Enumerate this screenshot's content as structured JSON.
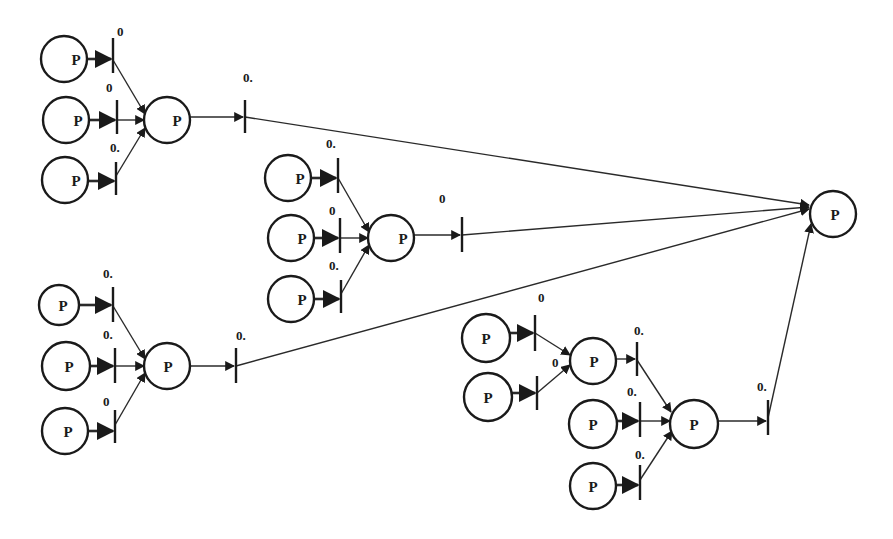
{
  "diagram": {
    "type": "petri-net",
    "colors": {
      "stroke": "#1a1a1a",
      "background": "#ffffff"
    },
    "places": [
      {
        "id": "p1",
        "label": "P",
        "cx": 64,
        "cy": 59,
        "r": 23,
        "lx": 76,
        "ly": 65
      },
      {
        "id": "p2",
        "label": "P",
        "cx": 66,
        "cy": 120,
        "r": 23,
        "lx": 78,
        "ly": 126
      },
      {
        "id": "p3",
        "label": "P",
        "cx": 65,
        "cy": 180,
        "r": 23,
        "lx": 76,
        "ly": 186
      },
      {
        "id": "p4",
        "label": "P",
        "cx": 167,
        "cy": 120,
        "r": 23,
        "lx": 177,
        "ly": 126
      },
      {
        "id": "p5",
        "label": "P",
        "cx": 288,
        "cy": 178,
        "r": 23,
        "lx": 300,
        "ly": 184
      },
      {
        "id": "p6",
        "label": "P",
        "cx": 291,
        "cy": 238,
        "r": 23,
        "lx": 302,
        "ly": 244
      },
      {
        "id": "p7",
        "label": "P",
        "cx": 291,
        "cy": 299,
        "r": 23,
        "lx": 302,
        "ly": 305
      },
      {
        "id": "p8",
        "label": "P",
        "cx": 391,
        "cy": 238,
        "r": 23,
        "lx": 403,
        "ly": 244
      },
      {
        "id": "p9",
        "label": "P",
        "cx": 59,
        "cy": 305,
        "r": 20,
        "lx": 63,
        "ly": 311
      },
      {
        "id": "p10",
        "label": "P",
        "cx": 66,
        "cy": 366,
        "r": 24,
        "lx": 69,
        "ly": 372
      },
      {
        "id": "p11",
        "label": "P",
        "cx": 65,
        "cy": 431,
        "r": 23,
        "lx": 68,
        "ly": 437
      },
      {
        "id": "p12",
        "label": "P",
        "cx": 167,
        "cy": 366,
        "r": 23,
        "lx": 168,
        "ly": 372
      },
      {
        "id": "p13",
        "label": "P",
        "cx": 486,
        "cy": 338,
        "r": 24,
        "lx": 486,
        "ly": 344
      },
      {
        "id": "p14",
        "label": "P",
        "cx": 488,
        "cy": 397,
        "r": 24,
        "lx": 488,
        "ly": 403
      },
      {
        "id": "p15",
        "label": "P",
        "cx": 593,
        "cy": 361,
        "r": 23,
        "lx": 594,
        "ly": 367
      },
      {
        "id": "p16",
        "label": "P",
        "cx": 593,
        "cy": 424,
        "r": 24,
        "lx": 593,
        "ly": 430
      },
      {
        "id": "p17",
        "label": "P",
        "cx": 593,
        "cy": 486,
        "r": 23,
        "lx": 593,
        "ly": 492
      },
      {
        "id": "p18",
        "label": "P",
        "cx": 694,
        "cy": 424,
        "r": 24,
        "lx": 694,
        "ly": 430
      },
      {
        "id": "p19",
        "label": "P",
        "cx": 833,
        "cy": 214,
        "r": 23,
        "lx": 835,
        "ly": 220
      }
    ],
    "transitions": [
      {
        "id": "t1",
        "x": 113,
        "y1": 38,
        "y2": 73,
        "label": "0",
        "lx": 117,
        "ly": 36
      },
      {
        "id": "t2",
        "x": 117,
        "y1": 100,
        "y2": 134,
        "label": "0",
        "lx": 106,
        "ly": 92
      },
      {
        "id": "t3",
        "x": 116,
        "y1": 162,
        "y2": 195,
        "label": "0.",
        "lx": 110,
        "ly": 152
      },
      {
        "id": "t4",
        "x": 245,
        "y1": 100,
        "y2": 133,
        "label": "0.",
        "lx": 243,
        "ly": 82
      },
      {
        "id": "t5",
        "x": 338,
        "y1": 158,
        "y2": 193,
        "label": "0.",
        "lx": 326,
        "ly": 148
      },
      {
        "id": "t6",
        "x": 340,
        "y1": 218,
        "y2": 253,
        "label": "0",
        "lx": 329,
        "ly": 215
      },
      {
        "id": "t7",
        "x": 341,
        "y1": 280,
        "y2": 313,
        "label": "0.",
        "lx": 329,
        "ly": 270
      },
      {
        "id": "t8",
        "x": 462,
        "y1": 217,
        "y2": 252,
        "label": "0",
        "lx": 439,
        "ly": 203
      },
      {
        "id": "t9",
        "x": 113,
        "y1": 287,
        "y2": 322,
        "label": "0.",
        "lx": 103,
        "ly": 278
      },
      {
        "id": "t10",
        "x": 115,
        "y1": 348,
        "y2": 383,
        "label": "0.",
        "lx": 103,
        "ly": 339
      },
      {
        "id": "t11",
        "x": 115,
        "y1": 410,
        "y2": 443,
        "label": "0",
        "lx": 103,
        "ly": 406
      },
      {
        "id": "t12",
        "x": 236,
        "y1": 348,
        "y2": 383,
        "label": "0.",
        "lx": 236,
        "ly": 340
      },
      {
        "id": "t13",
        "x": 535,
        "y1": 315,
        "y2": 351,
        "label": "0",
        "lx": 538,
        "ly": 302
      },
      {
        "id": "t14",
        "x": 537,
        "y1": 376,
        "y2": 410,
        "label": "0",
        "lx": 552,
        "ly": 367
      },
      {
        "id": "t15",
        "x": 637,
        "y1": 342,
        "y2": 376,
        "label": "0.",
        "lx": 634,
        "ly": 335
      },
      {
        "id": "t16",
        "x": 640,
        "y1": 402,
        "y2": 437,
        "label": "0.",
        "lx": 627,
        "ly": 396
      },
      {
        "id": "t17",
        "x": 640,
        "y1": 465,
        "y2": 500,
        "label": "0.",
        "lx": 635,
        "ly": 459
      },
      {
        "id": "t18",
        "x": 768,
        "y1": 400,
        "y2": 435,
        "label": "0.",
        "lx": 757,
        "ly": 391
      }
    ],
    "arcs": [
      {
        "x1": 87,
        "y1": 59,
        "x2": 111,
        "y2": 59,
        "thick": true
      },
      {
        "x1": 89,
        "y1": 120,
        "x2": 115,
        "y2": 120,
        "thick": true
      },
      {
        "x1": 88,
        "y1": 181,
        "x2": 114,
        "y2": 181,
        "thick": true
      },
      {
        "x1": 113,
        "y1": 60,
        "x2": 145,
        "y2": 114,
        "thick": false
      },
      {
        "x1": 117,
        "y1": 120,
        "x2": 144,
        "y2": 120,
        "thick": false
      },
      {
        "x1": 116,
        "y1": 176,
        "x2": 145,
        "y2": 128,
        "thick": false
      },
      {
        "x1": 190,
        "y1": 117,
        "x2": 243,
        "y2": 117,
        "thick": false
      },
      {
        "x1": 245,
        "y1": 117,
        "x2": 809,
        "y2": 205,
        "thick": false
      },
      {
        "x1": 311,
        "y1": 178,
        "x2": 336,
        "y2": 178,
        "thick": true
      },
      {
        "x1": 314,
        "y1": 238,
        "x2": 338,
        "y2": 238,
        "thick": true
      },
      {
        "x1": 314,
        "y1": 299,
        "x2": 339,
        "y2": 299,
        "thick": true
      },
      {
        "x1": 338,
        "y1": 178,
        "x2": 369,
        "y2": 232,
        "thick": false
      },
      {
        "x1": 340,
        "y1": 238,
        "x2": 368,
        "y2": 238,
        "thick": false
      },
      {
        "x1": 341,
        "y1": 294,
        "x2": 369,
        "y2": 245,
        "thick": false
      },
      {
        "x1": 414,
        "y1": 235,
        "x2": 460,
        "y2": 235,
        "thick": false
      },
      {
        "x1": 462,
        "y1": 235,
        "x2": 809,
        "y2": 207,
        "thick": false
      },
      {
        "x1": 79,
        "y1": 305,
        "x2": 111,
        "y2": 305,
        "thick": true
      },
      {
        "x1": 90,
        "y1": 366,
        "x2": 113,
        "y2": 366,
        "thick": true
      },
      {
        "x1": 88,
        "y1": 431,
        "x2": 113,
        "y2": 431,
        "thick": true
      },
      {
        "x1": 113,
        "y1": 306,
        "x2": 145,
        "y2": 359,
        "thick": false
      },
      {
        "x1": 115,
        "y1": 366,
        "x2": 144,
        "y2": 366,
        "thick": false
      },
      {
        "x1": 115,
        "y1": 425,
        "x2": 145,
        "y2": 373,
        "thick": false
      },
      {
        "x1": 190,
        "y1": 366,
        "x2": 234,
        "y2": 366,
        "thick": false
      },
      {
        "x1": 236,
        "y1": 366,
        "x2": 809,
        "y2": 209,
        "thick": false
      },
      {
        "x1": 510,
        "y1": 333,
        "x2": 533,
        "y2": 333,
        "thick": true
      },
      {
        "x1": 512,
        "y1": 393,
        "x2": 535,
        "y2": 393,
        "thick": true
      },
      {
        "x1": 535,
        "y1": 333,
        "x2": 570,
        "y2": 355,
        "thick": false
      },
      {
        "x1": 537,
        "y1": 393,
        "x2": 570,
        "y2": 365,
        "thick": false
      },
      {
        "x1": 616,
        "y1": 359,
        "x2": 635,
        "y2": 359,
        "thick": false
      },
      {
        "x1": 637,
        "y1": 360,
        "x2": 671,
        "y2": 412,
        "thick": false
      },
      {
        "x1": 617,
        "y1": 421,
        "x2": 638,
        "y2": 421,
        "thick": true
      },
      {
        "x1": 640,
        "y1": 421,
        "x2": 670,
        "y2": 421,
        "thick": false
      },
      {
        "x1": 616,
        "y1": 485,
        "x2": 638,
        "y2": 485,
        "thick": true
      },
      {
        "x1": 640,
        "y1": 480,
        "x2": 672,
        "y2": 431,
        "thick": false
      },
      {
        "x1": 718,
        "y1": 421,
        "x2": 766,
        "y2": 421,
        "thick": false
      },
      {
        "x1": 768,
        "y1": 418,
        "x2": 811,
        "y2": 224,
        "thick": false
      }
    ]
  }
}
